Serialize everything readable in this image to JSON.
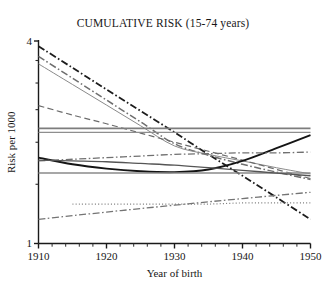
{
  "chart_data": {
    "type": "line",
    "title": "CUMULATIVE RISK (15-74 years)",
    "xlabel": "Year of birth",
    "ylabel": "Risk per 1000",
    "xlim": [
      1910,
      1950
    ],
    "ylim": [
      1,
      4
    ],
    "yscale": "log",
    "grid": false,
    "legend": "none",
    "xticks": [
      1910,
      1920,
      1930,
      1940,
      1950
    ],
    "xtick_labels": [
      "1910",
      "1920",
      "1930",
      "1940",
      "1950"
    ],
    "x_minor_tick_step": 2,
    "yticks": [
      1,
      4
    ],
    "ytick_labels": [
      "1",
      "4"
    ],
    "y_minor_ticks": [
      1.5,
      2,
      2.5,
      3,
      3.5
    ],
    "x": [
      1910,
      1915,
      1920,
      1925,
      1930,
      1935,
      1940,
      1945,
      1950
    ],
    "series": [
      {
        "name": "series-1-steep-decline-black",
        "style": "dash-dot",
        "color": "#1c1c1c",
        "width": 1.8,
        "values": [
          3.86,
          3.33,
          2.87,
          2.48,
          2.14,
          1.84,
          1.59,
          1.37,
          1.18
        ]
      },
      {
        "name": "series-2-steep-decline-gray",
        "style": "dash-dot",
        "color": "#6e6e6e",
        "width": 1.5,
        "values": [
          3.6,
          3.1,
          2.67,
          2.3,
          1.98,
          1.83,
          1.72,
          1.63,
          1.55
        ]
      },
      {
        "name": "series-3-decline-thin-gray",
        "style": "solid",
        "color": "#8a8a8a",
        "width": 1.0,
        "values": [
          3.42,
          2.97,
          2.58,
          2.24,
          1.95,
          1.84,
          1.76,
          1.68,
          1.61
        ]
      },
      {
        "name": "series-4-gentle-decline-dashed",
        "style": "dashed",
        "color": "#6b6b6b",
        "width": 1.2,
        "values": [
          2.57,
          2.41,
          2.27,
          2.13,
          2.0,
          1.88,
          1.77,
          1.66,
          1.56
        ]
      },
      {
        "name": "series-5-flat-upper-gray",
        "style": "solid",
        "color": "#7d7d7d",
        "width": 1.6,
        "values": [
          2.2,
          2.2,
          2.2,
          2.2,
          2.2,
          2.2,
          2.2,
          2.2,
          2.2
        ]
      },
      {
        "name": "series-6-flat-upper-gray-2",
        "style": "solid",
        "color": "#8e8e8e",
        "width": 1.3,
        "values": [
          2.14,
          2.14,
          2.14,
          2.14,
          2.14,
          2.14,
          2.14,
          2.14,
          2.14
        ]
      },
      {
        "name": "series-7-u-shape-black",
        "style": "solid",
        "color": "#141414",
        "width": 1.9,
        "values": [
          1.8,
          1.72,
          1.67,
          1.64,
          1.63,
          1.66,
          1.76,
          1.92,
          2.1
        ]
      },
      {
        "name": "series-8-slight-rise-dashdot",
        "style": "dash-dot",
        "color": "#707070",
        "width": 1.3,
        "values": [
          1.76,
          1.78,
          1.8,
          1.82,
          1.84,
          1.85,
          1.86,
          1.86,
          1.87
        ]
      },
      {
        "name": "series-9-flat-lower-gray",
        "style": "solid",
        "color": "#8a8a8a",
        "width": 1.5,
        "values": [
          1.62,
          1.62,
          1.62,
          1.62,
          1.62,
          1.62,
          1.62,
          1.62,
          1.62
        ]
      },
      {
        "name": "series-10-mild-decline-gray",
        "style": "solid",
        "color": "#555555",
        "width": 1.3,
        "values": [
          1.77,
          1.76,
          1.75,
          1.73,
          1.71,
          1.68,
          1.65,
          1.62,
          1.59
        ]
      },
      {
        "name": "series-11-dotted-flat",
        "style": "dotted",
        "color": "#777777",
        "width": 1.2,
        "values": [
          null,
          1.31,
          1.31,
          1.31,
          1.31,
          1.31,
          1.32,
          1.32,
          1.32
        ]
      },
      {
        "name": "series-12-rising-dashdot-low",
        "style": "dash-dot",
        "color": "#747474",
        "width": 1.3,
        "values": [
          1.18,
          1.21,
          1.24,
          1.27,
          1.3,
          1.33,
          1.36,
          1.39,
          1.42
        ]
      }
    ]
  }
}
